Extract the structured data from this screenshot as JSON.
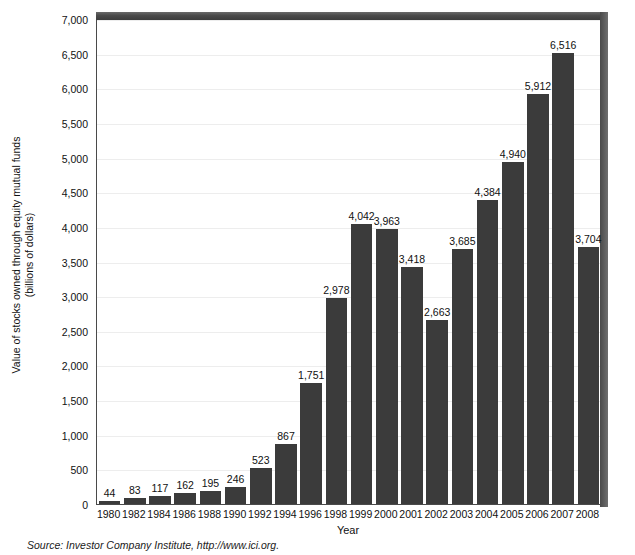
{
  "chart_data": {
    "type": "bar",
    "title": "",
    "xlabel": "Year",
    "ylabel": "Value of stocks owned through equity mutual funds (billions of dollars)",
    "ylabel_lines": [
      "Value of stocks owned through equity mutual funds",
      "(billions of dollars)"
    ],
    "ylim": [
      0,
      7000
    ],
    "ytick_step": 500,
    "yticks": [
      "0",
      "500",
      "1,000",
      "1,500",
      "2,000",
      "2,500",
      "3,000",
      "3,500",
      "4,000",
      "4,500",
      "5,000",
      "5,500",
      "6,000",
      "6,500",
      "7,000"
    ],
    "ytick_values": [
      0,
      500,
      1000,
      1500,
      2000,
      2500,
      3000,
      3500,
      4000,
      4500,
      5000,
      5500,
      6000,
      6500,
      7000
    ],
    "grid": true,
    "legend": "none",
    "categories": [
      "1980",
      "1982",
      "1984",
      "1986",
      "1988",
      "1990",
      "1992",
      "1994",
      "1996",
      "1998",
      "1999",
      "2000",
      "2001",
      "2002",
      "2003",
      "2004",
      "2005",
      "2006",
      "2007",
      "2008"
    ],
    "values": [
      44,
      83,
      117,
      162,
      195,
      246,
      523,
      867,
      1751,
      2978,
      4042,
      3963,
      3418,
      2663,
      3685,
      4384,
      4940,
      5912,
      6516,
      3704
    ],
    "data_labels": [
      "44",
      "83",
      "117",
      "162",
      "195",
      "246",
      "523",
      "867",
      "1,751",
      "2,978",
      "4,042",
      "3,963",
      "3,418",
      "2,663",
      "3,685",
      "4,384",
      "4,940",
      "5,912",
      "6,516",
      "3,704"
    ],
    "bar_color": "#3b3b3b",
    "grid_color": "#ededed",
    "frame_color": "#4a4a4a",
    "background": "#ffffff"
  },
  "footer": {
    "source": "Source: Investor Company Institute, http://www.ici.org."
  }
}
